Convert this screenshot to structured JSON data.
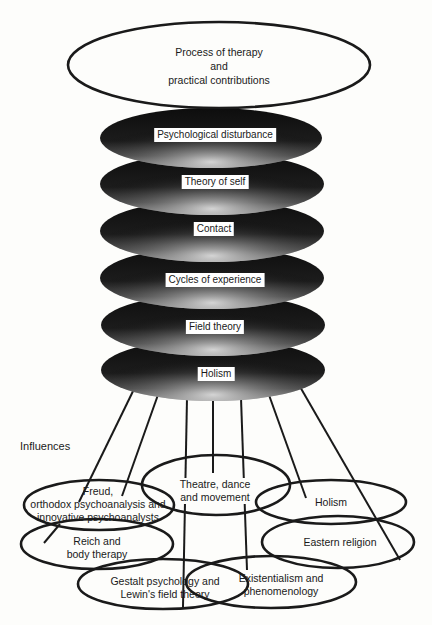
{
  "diagram": {
    "top": {
      "line1": "Process of therapy",
      "line2": "and",
      "line3": "practical contributions"
    },
    "layers": [
      {
        "label": "Psychological disturbance"
      },
      {
        "label": "Theory of self"
      },
      {
        "label": "Contact"
      },
      {
        "label": "Cycles of experience"
      },
      {
        "label": "Field theory"
      },
      {
        "label": "Holism"
      }
    ],
    "influences_heading": "Influences",
    "influences": [
      {
        "id": "freud",
        "line1": "Freud,",
        "line2": "orthodox psychoanalysis and",
        "line3": "innovative psychoanalysts"
      },
      {
        "id": "theatre",
        "line1": "Theatre, dance",
        "line2": "and movement"
      },
      {
        "id": "holism",
        "line1": "Holism"
      },
      {
        "id": "reich",
        "line1": "Reich and",
        "line2": "body therapy"
      },
      {
        "id": "eastern",
        "line1": "Eastern religion"
      },
      {
        "id": "gestalt",
        "line1": "Gestalt psychology and",
        "line2": "Lewin's field theory"
      },
      {
        "id": "existentialism",
        "line1": "Existentialism and",
        "line2": "phenomenology"
      }
    ]
  }
}
